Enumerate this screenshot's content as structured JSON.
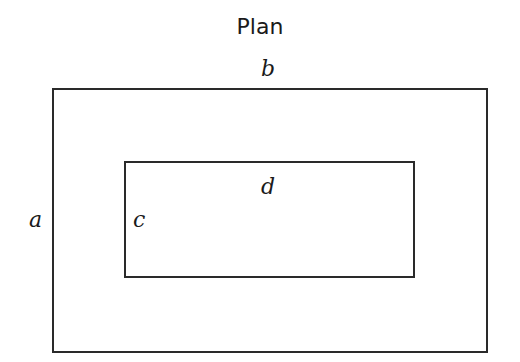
{
  "title": "Plan",
  "labels": {
    "a": "a",
    "b": "b",
    "c": "c",
    "d": "d"
  },
  "shapes": {
    "outer_rect": {
      "label_width": "b",
      "label_height": "a"
    },
    "inner_rect": {
      "label_width": "d",
      "label_height": "c"
    }
  },
  "colors": {
    "stroke": "#2a2a2a",
    "text": "#1a1a1a",
    "background": "#ffffff"
  }
}
